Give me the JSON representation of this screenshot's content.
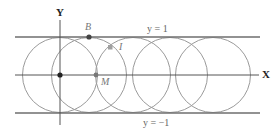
{
  "diagram": {
    "axes": {
      "x_label": "X",
      "y_label": "Y"
    },
    "lines": {
      "top_label": "y = 1",
      "bottom_label": "y = −1"
    },
    "points": {
      "B": "B",
      "I": "I",
      "M": "M"
    },
    "colors": {
      "line": "#6e6e6e",
      "circle": "#9a9a9a",
      "point": "#444444",
      "square_point": "#a0a0a0"
    }
  }
}
